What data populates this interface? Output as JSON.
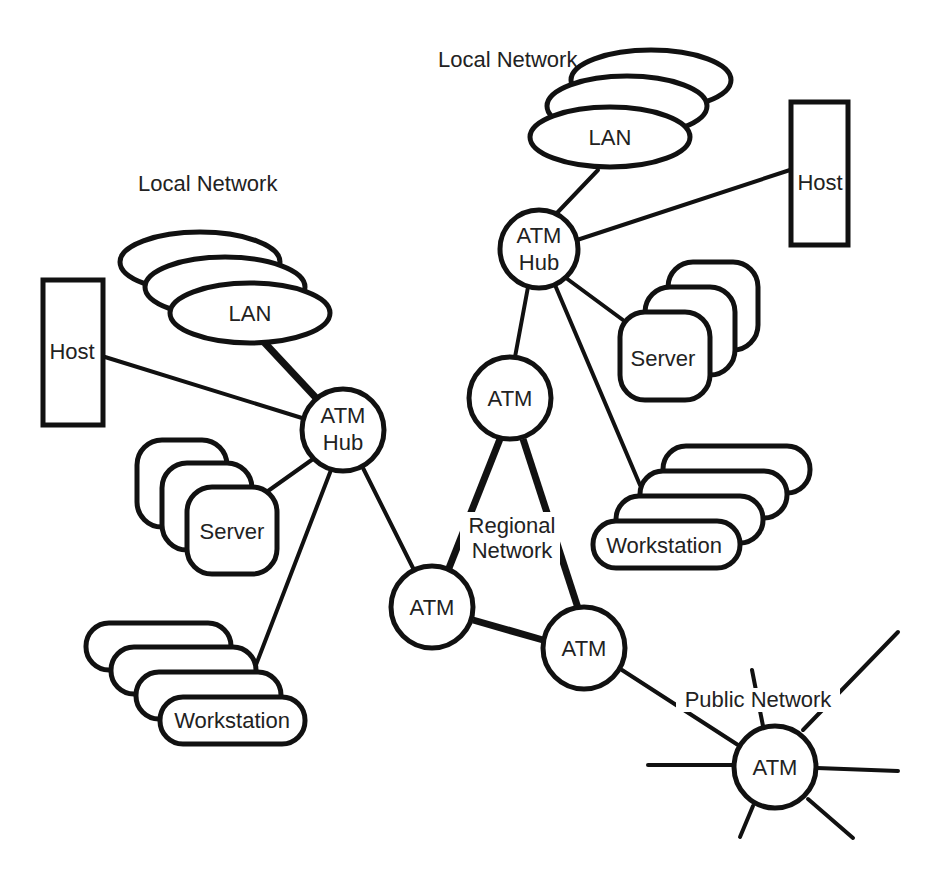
{
  "title_fragment": "",
  "groups": {
    "left_local": {
      "label": "Local Network"
    },
    "right_local": {
      "label": "Local Network"
    },
    "regional": {
      "label_line1": "Regional",
      "label_line2": "Network"
    },
    "public": {
      "label": "Public Network"
    }
  },
  "nodes": {
    "left_lan": "LAN",
    "left_host": "Host",
    "left_hub_line1": "ATM",
    "left_hub_line2": "Hub",
    "left_server": "Server",
    "left_workstation": "Workstation",
    "right_lan": "LAN",
    "right_host": "Host",
    "right_hub_line1": "ATM",
    "right_hub_line2": "Hub",
    "right_server": "Server",
    "right_workstation": "Workstation",
    "regional_top_atm": "ATM",
    "regional_left_atm": "ATM",
    "regional_right_atm": "ATM",
    "public_atm": "ATM"
  },
  "colors": {
    "stroke": "#111111",
    "background": "#ffffff",
    "text": "#222222"
  }
}
